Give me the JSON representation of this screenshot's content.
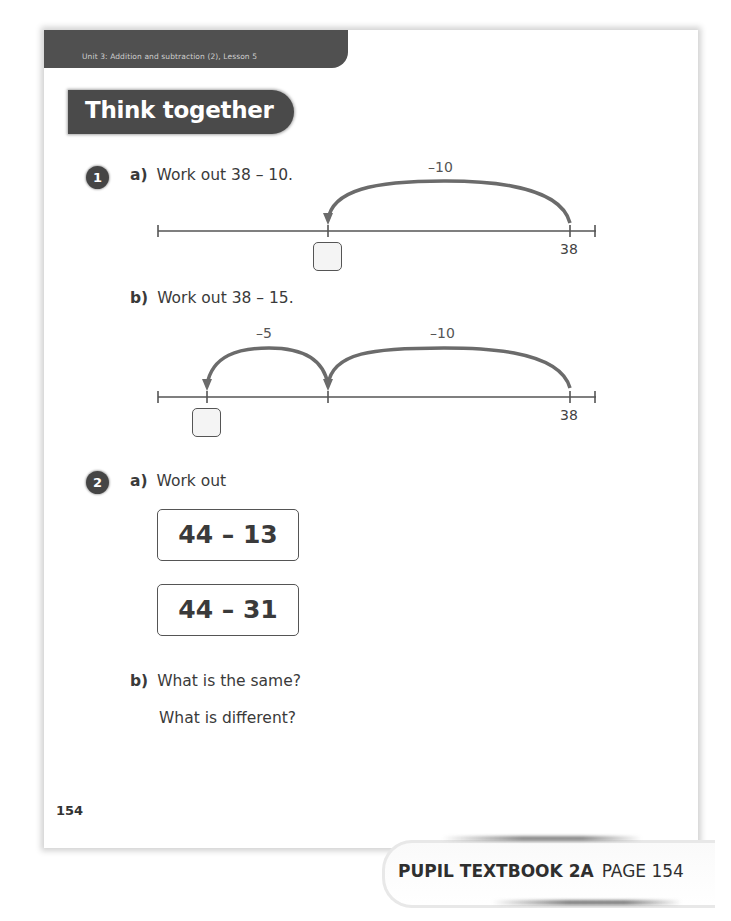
{
  "header": {
    "unit_title": "Unit 3: Addition and subtraction (2), Lesson 5",
    "section_title": "Think together"
  },
  "questions": [
    {
      "number": "1",
      "parts": [
        {
          "letter": "a)",
          "prompt": "Work out 38 – 10.",
          "number_line": {
            "start_label": "38",
            "jumps": [
              {
                "label": "–10"
              }
            ],
            "answer_box": ""
          }
        },
        {
          "letter": "b)",
          "prompt": "Work out 38 – 15.",
          "number_line": {
            "start_label": "38",
            "jumps": [
              {
                "label": "–10"
              },
              {
                "label": "–5"
              }
            ],
            "answer_box": ""
          }
        }
      ]
    },
    {
      "number": "2",
      "parts": [
        {
          "letter": "a)",
          "prompt": "Work out",
          "expressions": [
            "44 – 13",
            "44 – 31"
          ]
        },
        {
          "letter": "b)",
          "prompt": "What is the same?",
          "prompt2": "What is different?"
        }
      ]
    }
  ],
  "page_number": "154",
  "footer": {
    "book": "PUPIL TEXTBOOK 2A",
    "page": "PAGE 154"
  },
  "colors": {
    "header_bar": "#505050",
    "banner": "#4a4a4a",
    "arc": "#6b6b6b",
    "text": "#3a3a3a"
  }
}
